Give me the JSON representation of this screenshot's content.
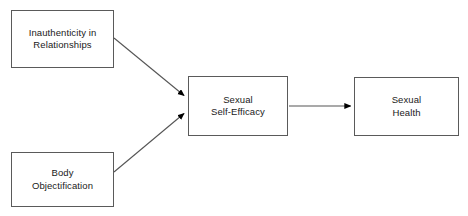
{
  "diagram": {
    "type": "path-model",
    "width": 468,
    "height": 216,
    "background_color": "#ffffff",
    "border_color": "#5a5a5a",
    "edge_color": "#555555",
    "arrowhead_color": "#000000",
    "text_color": "#1a1a1a",
    "nodes": [
      {
        "id": "inauthenticity",
        "label": "Inauthenticity in\nRelationships",
        "role": "predictor",
        "x": 11,
        "y": 10,
        "width": 103,
        "height": 58
      },
      {
        "id": "objectification",
        "label": "Body\nObjectification",
        "role": "predictor",
        "x": 11,
        "y": 152,
        "width": 103,
        "height": 55
      },
      {
        "id": "self_efficacy",
        "label": "Sexual\nSelf-Efficacy",
        "role": "mediator",
        "x": 188,
        "y": 76,
        "width": 100,
        "height": 60
      },
      {
        "id": "sexual_health",
        "label": "Sexual\nHealth",
        "role": "outcome",
        "x": 354,
        "y": 77,
        "width": 105,
        "height": 59
      }
    ],
    "edges": [
      {
        "id": "edge-inauthenticity-to-self-efficacy",
        "from": "inauthenticity",
        "to": "self_efficacy",
        "style": "solid",
        "direction": "one-way",
        "x1": 114,
        "y1": 38,
        "x2": 186,
        "y2": 97
      },
      {
        "id": "edge-objectification-to-self-efficacy",
        "from": "objectification",
        "to": "self_efficacy",
        "style": "solid",
        "direction": "one-way",
        "x1": 114,
        "y1": 172,
        "x2": 186,
        "y2": 112
      },
      {
        "id": "edge-self-efficacy-to-sexual-health",
        "from": "self_efficacy",
        "to": "sexual_health",
        "style": "solid",
        "direction": "one-way",
        "x1": 289,
        "y1": 106,
        "x2": 352,
        "y2": 106
      }
    ]
  }
}
